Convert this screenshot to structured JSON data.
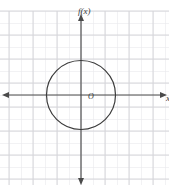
{
  "figure": {
    "width": 169,
    "height": 185,
    "background_color": "#ffffff"
  },
  "labels": {
    "function_label": "f(x)",
    "origin_label": "O",
    "x_axis_label": "x"
  },
  "colors": {
    "grid_minor": "#e9e9ec",
    "grid_major": "#d2d2d6",
    "axis": "#4a4a4a",
    "curve": "#3b3b3b",
    "text": "#3a3a3a"
  },
  "chart_data": {
    "type": "scatter",
    "title": "",
    "xlabel": "x",
    "ylabel": "f(x)",
    "grid": true,
    "legend": null,
    "axis_arrows": [
      "left",
      "right",
      "up",
      "down"
    ],
    "grid_spacing_px": 12,
    "origin_px": {
      "x": 81,
      "y": 95
    },
    "xlim": [
      -6.75,
      7.33
    ],
    "ylim": [
      -7.46,
      6.83
    ],
    "xticks": [],
    "yticks": [],
    "shapes": [
      {
        "kind": "circle",
        "center": [
          0,
          0
        ],
        "radius": 2.875,
        "center_px": [
          81,
          95
        ],
        "radius_px": 34.5,
        "stroke": "#3b3b3b",
        "fill": "none",
        "stroke_width": 1.2
      }
    ],
    "annotations": [
      {
        "text": "f(x)",
        "x_px": 78,
        "y_px": 7,
        "style": "italic"
      },
      {
        "text": "O",
        "x_px": 88,
        "y_px": 93,
        "style": "italic"
      },
      {
        "text": "x",
        "x_px": 166,
        "y_px": 94,
        "style": "italic"
      }
    ]
  }
}
